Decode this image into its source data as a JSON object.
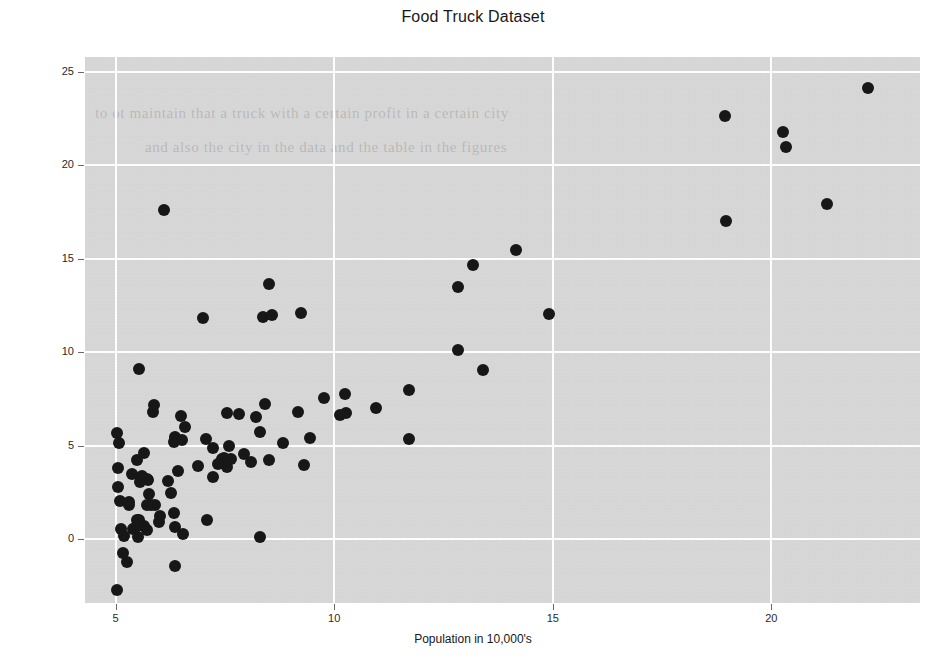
{
  "chart_data": {
    "type": "scatter",
    "title": "Food Truck Dataset",
    "xlabel": "Population in 10,000's",
    "ylabel": "Profit in $10,000's",
    "xlim": [
      4.3,
      23.4
    ],
    "ylim": [
      -3.4,
      25.8
    ],
    "xticks": [
      5,
      10,
      15,
      20
    ],
    "xtick_labels": [
      "5",
      "10",
      "15",
      "20"
    ],
    "yticks": [
      0,
      5,
      10,
      15,
      20,
      25
    ],
    "ytick_labels": [
      "0",
      "5",
      "10",
      "15",
      "20",
      "25"
    ],
    "grid": true,
    "legend": "none",
    "marker": "filled-circle",
    "marker_color": "#171717",
    "plot_background": "#d9d9d9",
    "gridline_color": "#fdfdfd",
    "series": [
      {
        "name": "Food trucks",
        "points": [
          [
            6.1101,
            17.592
          ],
          [
            5.5277,
            9.1302
          ],
          [
            8.5186,
            13.662
          ],
          [
            7.0032,
            11.854
          ],
          [
            5.8598,
            6.8233
          ],
          [
            8.3829,
            11.886
          ],
          [
            7.4764,
            4.3483
          ],
          [
            8.5781,
            12.0
          ],
          [
            6.4862,
            6.5987
          ],
          [
            5.0546,
            3.8166
          ],
          [
            5.7107,
            3.2522
          ],
          [
            14.164,
            15.505
          ],
          [
            5.734,
            3.1551
          ],
          [
            8.4084,
            7.2258
          ],
          [
            5.6407,
            0.71618
          ],
          [
            5.3794,
            3.5129
          ],
          [
            6.3654,
            5.3048
          ],
          [
            5.1301,
            0.56077
          ],
          [
            6.4296,
            3.6518
          ],
          [
            7.0708,
            5.3893
          ],
          [
            6.1891,
            3.1386
          ],
          [
            20.27,
            21.767
          ],
          [
            5.4901,
            4.263
          ],
          [
            6.3261,
            5.1875
          ],
          [
            5.5649,
            3.0825
          ],
          [
            18.945,
            22.638
          ],
          [
            12.828,
            13.501
          ],
          [
            10.957,
            7.0467
          ],
          [
            13.176,
            14.692
          ],
          [
            22.203,
            24.147
          ],
          [
            5.2524,
            -1.22
          ],
          [
            6.5894,
            5.9966
          ],
          [
            9.2482,
            12.134
          ],
          [
            5.8918,
            1.8495
          ],
          [
            8.2111,
            6.5426
          ],
          [
            7.9334,
            4.5623
          ],
          [
            8.0959,
            4.1164
          ],
          [
            5.6063,
            3.3928
          ],
          [
            12.836,
            10.117
          ],
          [
            6.3534,
            5.4974
          ],
          [
            5.4069,
            0.55657
          ],
          [
            6.8825,
            3.9115
          ],
          [
            11.708,
            5.3854
          ],
          [
            5.7737,
            2.4406
          ],
          [
            7.8247,
            6.7318
          ],
          [
            7.0931,
            1.0463
          ],
          [
            5.0702,
            5.1337
          ],
          [
            5.8014,
            1.844
          ],
          [
            11.7,
            8.0043
          ],
          [
            5.5416,
            1.0179
          ],
          [
            7.5402,
            6.7504
          ],
          [
            5.3077,
            1.8396
          ],
          [
            7.4239,
            4.2885
          ],
          [
            7.6031,
            4.9981
          ],
          [
            6.3328,
            1.4233
          ],
          [
            6.3589,
            -1.4211
          ],
          [
            6.2742,
            2.4756
          ],
          [
            5.6397,
            4.6042
          ],
          [
            9.3102,
            3.9624
          ],
          [
            9.4536,
            5.4141
          ],
          [
            8.8254,
            5.1694
          ],
          [
            5.1793,
            -0.74279
          ],
          [
            21.279,
            17.929
          ],
          [
            14.908,
            12.054
          ],
          [
            18.959,
            17.054
          ],
          [
            7.2182,
            4.8852
          ],
          [
            8.2951,
            5.7442
          ],
          [
            10.236,
            7.7754
          ],
          [
            5.4994,
            1.0173
          ],
          [
            20.341,
            20.992
          ],
          [
            10.136,
            6.6799
          ],
          [
            7.3345,
            4.0259
          ],
          [
            6.0062,
            1.2784
          ],
          [
            7.2259,
            3.3411
          ],
          [
            5.0269,
            -2.6807
          ],
          [
            6.5479,
            0.29678
          ],
          [
            7.5386,
            3.8845
          ],
          [
            5.0365,
            5.7014
          ],
          [
            10.274,
            6.7526
          ],
          [
            5.1077,
            2.0576
          ],
          [
            5.7292,
            0.47953
          ],
          [
            5.1884,
            0.20421
          ],
          [
            6.3557,
            0.67861
          ],
          [
            9.7687,
            7.5435
          ],
          [
            6.5159,
            5.3436
          ],
          [
            8.5172,
            4.2415
          ],
          [
            9.1802,
            6.7981
          ],
          [
            6.002,
            0.92695
          ],
          [
            5.5204,
            0.152
          ],
          [
            5.0594,
            2.8214
          ],
          [
            5.7077,
            1.8451
          ],
          [
            7.6366,
            4.2959
          ],
          [
            5.8707,
            7.2029
          ],
          [
            5.3054,
            1.9869
          ],
          [
            8.2934,
            0.14454
          ],
          [
            13.394,
            9.0551
          ],
          [
            5.4369,
            0.61705
          ]
        ]
      }
    ]
  }
}
